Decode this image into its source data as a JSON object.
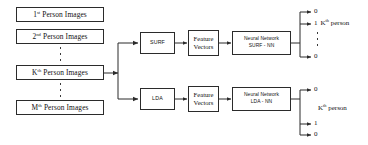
{
  "diagram": {
    "stroke_color": "#2b2b2b",
    "text_color": "#111111",
    "background": "#ffffff",
    "inputs": [
      {
        "id": "person-1",
        "label_main": "1",
        "label_sup": "st",
        "label_rest": " Person Images"
      },
      {
        "id": "person-2",
        "label_main": "2",
        "label_sup": "nd",
        "label_rest": " Person Images"
      },
      {
        "id": "person-k",
        "label_main": "K",
        "label_sup": "th",
        "label_rest": " Person Images"
      },
      {
        "id": "person-m",
        "label_main": "M",
        "label_sup": "th",
        "label_rest": " Person Images"
      }
    ],
    "branches": [
      {
        "id": "surf",
        "extractor": "SURF",
        "features_line1": "Feature",
        "features_line2": "Vectors",
        "classifier_line1": "Neural Network",
        "classifier_line2": "SURF - NN",
        "outputs": [
          {
            "value": "0",
            "note": ""
          },
          {
            "value": "1",
            "note_main": "K",
            "note_sup": "th",
            "note_rest": " person"
          },
          {
            "value": "0",
            "note": ""
          }
        ]
      },
      {
        "id": "lda",
        "extractor": "LDA",
        "features_line1": "Feature",
        "features_line2": "Vectors",
        "classifier_line1": "Neural Network",
        "classifier_line2": "LDA - NN",
        "outputs": [
          {
            "value": "0",
            "note": ""
          },
          {
            "value": "1",
            "note": ""
          },
          {
            "value": "0",
            "note": ""
          }
        ],
        "group_note_main": "K",
        "group_note_sup": "th",
        "group_note_rest": " person"
      }
    ]
  }
}
